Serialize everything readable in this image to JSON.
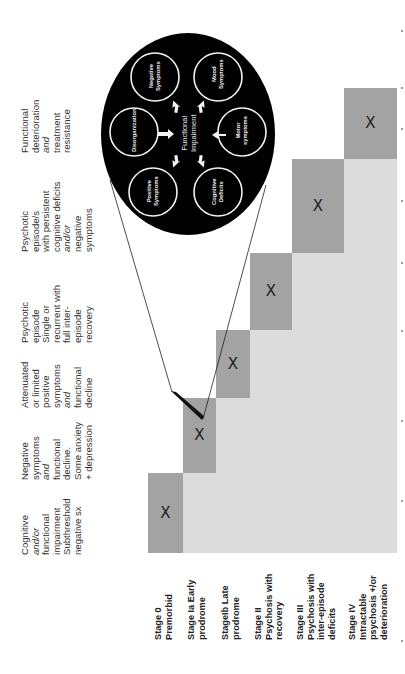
{
  "figure": {
    "orientation": "rotated -90deg (text reads bottom-to-top)",
    "colors": {
      "background": "#ffffff",
      "region_light": "#dcdcdc",
      "stage_block": "#a3a3a3",
      "inset_circle": "#000000",
      "inset_ring": "#ffffff"
    }
  },
  "column_headers": [
    {
      "lines": [
        "Cognitive",
        "and/or",
        "functional",
        "impairment",
        "Subthreshold",
        "negative sx"
      ],
      "italic_lines": [
        1
      ]
    },
    {
      "lines": [
        "Negative",
        "symptoms",
        "and",
        "functional",
        "decline.",
        "Some anxiety",
        "+ depression"
      ],
      "italic_lines": [
        2
      ]
    },
    {
      "lines": [
        "Attenuated",
        "or limited",
        "positive",
        "symptoms",
        "and",
        "functional",
        "decline"
      ],
      "italic_lines": [
        4
      ]
    },
    {
      "lines": [
        "Psychotic",
        "episode",
        "Single or",
        "recurrent with",
        "full inter-",
        "episode",
        "recovery"
      ],
      "italic_lines": []
    },
    {
      "lines": [
        "Psychotic",
        "episode/s",
        "with persistent",
        "cognitive deficits",
        "and/or",
        "negative",
        "symptoms"
      ],
      "italic_lines": [
        4
      ]
    },
    {
      "lines": [
        "Functional",
        "deterioration",
        "and",
        "treatment",
        "resistance"
      ],
      "italic_lines": [
        2
      ]
    }
  ],
  "stages": [
    {
      "lines": [
        "Stage 0",
        "Premorbid"
      ],
      "mark": "X"
    },
    {
      "lines": [
        "Stage Ia Early",
        "prodrome"
      ],
      "mark": "X"
    },
    {
      "lines": [
        "StageIb Late",
        "prodrome"
      ],
      "mark": "X"
    },
    {
      "lines": [
        "Stage II",
        "Psychosis with",
        "recovery"
      ],
      "mark": "X"
    },
    {
      "lines": [
        "Stage III",
        "Psychosis with",
        "inter-episode",
        "deficits"
      ],
      "mark": "X"
    },
    {
      "lines": [
        "Stage IV",
        "Intractable",
        "psychosis +/or",
        "deterioration"
      ],
      "mark": "X"
    }
  ],
  "inset": {
    "center_label": [
      "Functional",
      "Impairment"
    ],
    "domains": [
      {
        "id": "negative",
        "lines": [
          "Negative",
          "Symptoms"
        ]
      },
      {
        "id": "mood",
        "lines": [
          "Mood",
          "Symptoms"
        ]
      },
      {
        "id": "disorganization",
        "lines": [
          "Disorganization"
        ]
      },
      {
        "id": "motor",
        "lines": [
          "Motor",
          "symptoms"
        ]
      },
      {
        "id": "positive",
        "lines": [
          "Positive",
          "Symptoms"
        ]
      },
      {
        "id": "cognitive",
        "lines": [
          "Cognitive",
          "Deficits"
        ]
      }
    ],
    "zoom_source_stage": "Stage Ia Early prodrome"
  }
}
